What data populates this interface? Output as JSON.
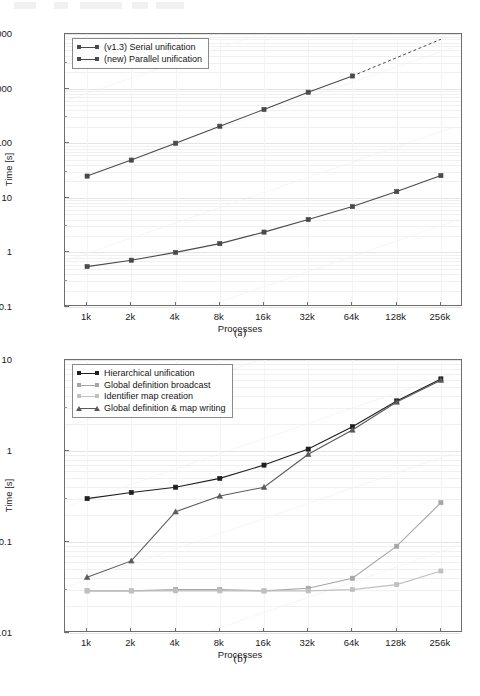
{
  "document": {
    "page_header_visible": true
  },
  "figures": [
    {
      "caption": "(a)",
      "ylabel": "Time [s]",
      "xlabel": "Processes",
      "legend": [
        {
          "label": "(v1.3) Serial unification",
          "color": "#4a4a4a",
          "marker": "square"
        },
        {
          "label": "(new) Parallel unification",
          "color": "#4a4a4a",
          "marker": "square"
        }
      ],
      "yticks": [
        "10000",
        "1000",
        "100",
        "10",
        "1",
        "0.1"
      ],
      "xticks": [
        "1k",
        "2k",
        "4k",
        "8k",
        "16k",
        "32k",
        "64k",
        "128k",
        "256k"
      ],
      "chart_data": {
        "type": "line",
        "title": "",
        "xlabel": "Processes",
        "ylabel": "Time [s]",
        "xscale": "log2",
        "yscale": "log10",
        "ylim": [
          0.1,
          10000
        ],
        "grid": true,
        "legend_position": "top-left",
        "categories": [
          "1k",
          "2k",
          "4k",
          "8k",
          "16k",
          "32k",
          "64k",
          "128k",
          "256k"
        ],
        "x": [
          1024,
          2048,
          4096,
          8192,
          16384,
          32768,
          65536,
          131072,
          262144
        ],
        "series": [
          {
            "name": "(v1.3) Serial unification",
            "marker": "square",
            "color": "#4a4a4a",
            "values": [
              25,
              49,
              100,
              205,
              415,
              860,
              1700,
              null,
              null
            ],
            "extrapolated_dashed_to": 8000,
            "note": "dashed extrapolation beyond 64k"
          },
          {
            "name": "(new) Parallel unification",
            "marker": "square",
            "color": "#4a4a4a",
            "values": [
              0.55,
              0.72,
              1.0,
              1.45,
              2.35,
              4.0,
              6.9,
              13.0,
              25.5
            ]
          }
        ]
      }
    },
    {
      "caption": "(b)",
      "ylabel": "Time [s]",
      "xlabel": "Processes",
      "legend": [
        {
          "label": "Hierarchical unification",
          "color": "#1f1f1f",
          "marker": "square"
        },
        {
          "label": "Global definition broadcast",
          "color": "#a6a6a6",
          "marker": "square"
        },
        {
          "label": "Identifier map creation",
          "color": "#c0c0c0",
          "marker": "square"
        },
        {
          "label": "Global definition & map writing",
          "color": "#5a5a5a",
          "marker": "triangle"
        }
      ],
      "yticks": [
        "10",
        "1",
        "0.1",
        "0.01"
      ],
      "xticks": [
        "1k",
        "2k",
        "4k",
        "8k",
        "16k",
        "32k",
        "64k",
        "128k",
        "256k"
      ],
      "chart_data": {
        "type": "line",
        "title": "",
        "xlabel": "Processes",
        "ylabel": "Time [s]",
        "xscale": "log2",
        "yscale": "log10",
        "ylim": [
          0.01,
          10
        ],
        "grid": true,
        "legend_position": "top-left",
        "categories": [
          "1k",
          "2k",
          "4k",
          "8k",
          "16k",
          "32k",
          "64k",
          "128k",
          "256k"
        ],
        "x": [
          1024,
          2048,
          4096,
          8192,
          16384,
          32768,
          65536,
          131072,
          262144
        ],
        "series": [
          {
            "name": "Hierarchical unification",
            "marker": "square",
            "color": "#1f1f1f",
            "values": [
              0.3,
              0.35,
              0.4,
              0.5,
              0.7,
              1.05,
              1.85,
              3.55,
              6.2
            ]
          },
          {
            "name": "Global definition broadcast",
            "marker": "square",
            "color": "#a6a6a6",
            "values": [
              0.029,
              0.029,
              0.03,
              0.03,
              0.029,
              0.031,
              0.04,
              0.09,
              0.27
            ]
          },
          {
            "name": "Identifier map creation",
            "marker": "square",
            "color": "#c0c0c0",
            "values": [
              0.029,
              0.029,
              0.029,
              0.029,
              0.029,
              0.029,
              0.03,
              0.034,
              0.048
            ]
          },
          {
            "name": "Global definition & map writing",
            "marker": "triangle",
            "color": "#5a5a5a",
            "values": [
              0.041,
              0.062,
              0.215,
              0.32,
              0.4,
              0.92,
              1.7,
              3.45,
              6.0
            ]
          }
        ]
      }
    }
  ]
}
